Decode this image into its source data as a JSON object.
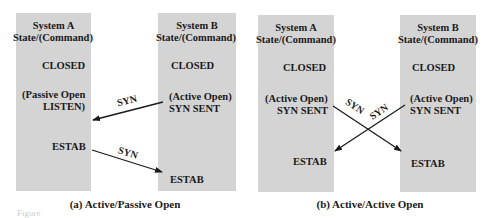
{
  "panel_a": {
    "caption": "(a) Active/Passive Open",
    "system_a": {
      "title": "System A",
      "subtitle": "State/(Command)",
      "states": [
        "CLOSED",
        "(Passive Open",
        "LISTEN)",
        "ESTAB"
      ]
    },
    "system_b": {
      "title": "System B",
      "subtitle": "State/(Command)",
      "states": [
        "CLOSED",
        "(Active Open)",
        "SYN SENT",
        "ESTAB"
      ]
    },
    "messages": [
      {
        "label": "SYN",
        "from": "System B",
        "to": "System A"
      },
      {
        "label": "SYN",
        "from": "System A",
        "to": "System B"
      }
    ]
  },
  "panel_b": {
    "caption": "(b) Active/Active Open",
    "system_a": {
      "title": "System A",
      "subtitle": "State/(Command)",
      "states": [
        "CLOSED",
        "(Active Open)",
        "SYN SENT",
        "ESTAB"
      ]
    },
    "system_b": {
      "title": "System B",
      "subtitle": "State/(Command)",
      "states": [
        "CLOSED",
        "(Active Open)",
        "SYN SENT",
        "ESTAB"
      ]
    },
    "messages": [
      {
        "label": "SYN",
        "from": "System A",
        "to": "System B"
      },
      {
        "label": "SYN",
        "from": "System B",
        "to": "System A"
      }
    ]
  },
  "figure_fragment": "Figure"
}
